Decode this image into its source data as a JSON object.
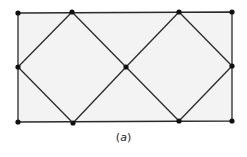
{
  "diagram": {
    "caption_open": "(",
    "caption_letter": "a",
    "caption_close": ")",
    "colors": {
      "fill": "#f3f3f3",
      "line": "#2a2a2a",
      "node": "#111111"
    },
    "nodes": [
      {
        "id": "TL",
        "x": 18,
        "y": 13
      },
      {
        "id": "T1",
        "x": 72,
        "y": 12
      },
      {
        "id": "T2",
        "x": 179,
        "y": 12
      },
      {
        "id": "TR",
        "x": 232,
        "y": 12
      },
      {
        "id": "L",
        "x": 18,
        "y": 67
      },
      {
        "id": "C",
        "x": 126,
        "y": 67
      },
      {
        "id": "R",
        "x": 232,
        "y": 66
      },
      {
        "id": "BL",
        "x": 18,
        "y": 122
      },
      {
        "id": "B1",
        "x": 73,
        "y": 123
      },
      {
        "id": "B2",
        "x": 179,
        "y": 121
      },
      {
        "id": "BR",
        "x": 232,
        "y": 121
      }
    ]
  }
}
